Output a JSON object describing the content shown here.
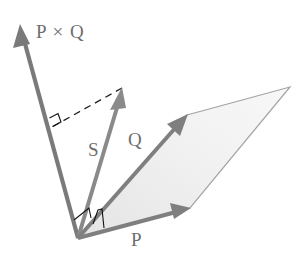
{
  "diagram": {
    "type": "vector-cross-product",
    "colors": {
      "vector": "#7a7a7a",
      "parallelogram_fill": "#eeeeee",
      "parallelogram_edge": "#9a9a9a",
      "marker": "#111111",
      "dashed": "#222222",
      "label": "#6e6e6e"
    },
    "origin": [
      78,
      238
    ],
    "vectors": [
      {
        "id": "pxq",
        "label": "P × Q",
        "tip": [
          20,
          25
        ]
      },
      {
        "id": "s",
        "label": "S",
        "tip": [
          122,
          88
        ]
      },
      {
        "id": "q",
        "label": "Q",
        "tip": [
          187,
          115
        ]
      },
      {
        "id": "p",
        "label": "P",
        "tip": [
          190,
          208
        ]
      }
    ],
    "parallelogram": {
      "vertices": [
        [
          78,
          238
        ],
        [
          190,
          208
        ],
        [
          290,
          87
        ],
        [
          187,
          115
        ]
      ]
    },
    "projection": {
      "from": [
        122,
        88
      ],
      "to": [
        52,
        127
      ],
      "style": "dashed"
    },
    "right_angle_markers": [
      "projection-foot-on-pxq",
      "pxq-perpendicular-to-plane",
      "s-perpendicular-marker-at-origin"
    ]
  },
  "labels": {
    "pxq": "P × Q",
    "s": "S",
    "q": "Q",
    "p": "P"
  }
}
